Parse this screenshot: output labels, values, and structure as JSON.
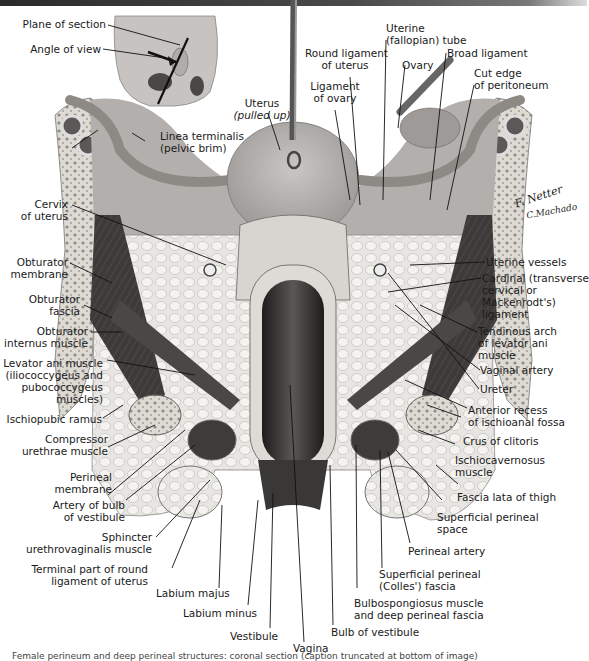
{
  "figure": {
    "type": "anatomical-illustration",
    "inset": {
      "labels": [
        "Plane of section",
        "Angle of view"
      ]
    },
    "signature": {
      "artist": "F. Netter M.D.",
      "coartist": "C. Machado M.D."
    },
    "caption_partial": "Female perineum and pelvis: coronal section (caption cut off at bottom edge)"
  },
  "labels": {
    "plane_of_section": "Plane of section",
    "angle_of_view": "Angle of view",
    "uterus": "Uterus",
    "uterus_note": "(pulled up)",
    "linea_terminalis": "Linea terminalis\n(pelvic brim)",
    "ligament_of_ovary": "Ligament\nof ovary",
    "round_ligament": "Round ligament\nof uterus",
    "uterine_tube": "Uterine\n(fallopian) tube",
    "ovary": "Ovary",
    "broad_ligament": "Broad ligament",
    "cut_edge_peritoneum": "Cut edge\nof peritoneum",
    "cervix": "Cervix\nof uterus",
    "obturator_membrane": "Obturator\nmembrane",
    "obturator_fascia": "Obturator\nfascia",
    "obturator_internus": "Obturator\ninternus muscle",
    "levator_ani": "Levator ani muscle\n(iliococcygeus and\npubococcygeus\nmuscles)",
    "ischiopubic_ramus": "Ischiopubic ramus",
    "compressor_urethrae": "Compressor\nurethrae muscle",
    "perineal_membrane": "Perineal\nmembrane",
    "artery_bulb": "Artery of bulb\nof vestibule",
    "sphincter_urethrovaginalis": "Sphincter\nurethrovaginalis muscle",
    "terminal_round_ligament": "Terminal part of round\nligament of uterus",
    "labium_majus": "Labium majus",
    "labium_minus": "Labium minus",
    "vestibule": "Vestibule",
    "vagina": "Vagina",
    "bulb_vestibule": "Bulb of vestibule",
    "bulbospongiosus": "Bulbospongiosus muscle\nand deep perineal fascia",
    "colles_fascia": "Superficial perineal\n(Colles') fascia",
    "perineal_artery": "Perineal artery",
    "superficial_perineal_space": "Superficial perineal\nspace",
    "fascia_lata": "Fascia lata of thigh",
    "ischiocavernosus": "Ischiocavernosus\nmuscle",
    "crus_clitoris": "Crus of clitoris",
    "anterior_recess": "Anterior recess\nof ischioanal fossa",
    "ureter": "Ureter",
    "vaginal_artery": "Vaginal artery",
    "tendinous_arch": "Tendinous arch\nof levator ani\nmuscle",
    "cardinal_ligament": "Cardinal (transverse\ncervical or\nMackenrodt's)\nligament",
    "uterine_vessels": "Uterine vessels"
  },
  "signature_text": {
    "line1": "F. Netter",
    "line2": "C.Machado"
  },
  "caption": "Female perineum and deep perineal structures: coronal section (caption truncated at bottom of image)",
  "colors": {
    "tissue_light": "#e6e3df",
    "tissue_mid": "#a9a5a1",
    "muscle_dark": "#3a3736",
    "vagina_dark": "#2f2d2c",
    "bone": "#d6d2cc",
    "leader_line": "#111111"
  }
}
